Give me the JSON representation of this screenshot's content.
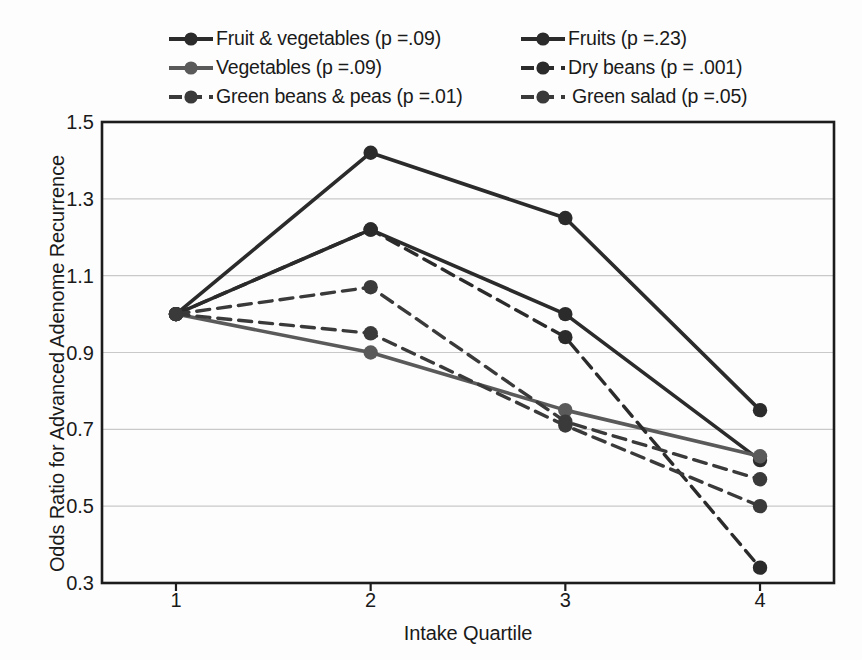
{
  "chart_data": {
    "type": "line",
    "title": "",
    "xlabel": "Intake Quartile",
    "ylabel": "Odds Ratio for Advanced Adenome Recurrence",
    "categories": [
      "1",
      "2",
      "3",
      "4"
    ],
    "x": [
      1,
      2,
      3,
      4
    ],
    "xlim": [
      0.62,
      4.38
    ],
    "ylim": [
      0.3,
      1.5
    ],
    "yticks": [
      "0.3",
      "0.5",
      "0.7",
      "0.9",
      "1.1",
      "1.3",
      "1.5"
    ],
    "ytick_values": [
      0.3,
      0.5,
      0.7,
      0.9,
      1.1,
      1.3,
      1.5
    ],
    "grid": "horizontal",
    "legend_position": "above-plot-two-columns",
    "series": [
      {
        "name": "Fruit & vegetables (p =.09)",
        "short_name": "Fruit & vegetables",
        "p_value": ".09",
        "values": [
          1.0,
          1.22,
          1.0,
          0.62
        ],
        "style": "solid",
        "color": "#2b2b2b",
        "width": 3.6
      },
      {
        "name": "Fruits (p =.23)",
        "short_name": "Fruits",
        "p_value": ".23",
        "values": [
          1.0,
          1.42,
          1.25,
          0.75
        ],
        "style": "solid",
        "color": "#2b2b2b",
        "width": 3.6
      },
      {
        "name": "Vegetables (p =.09)",
        "short_name": "Vegetables",
        "p_value": ".09",
        "values": [
          1.0,
          0.9,
          0.75,
          0.63
        ],
        "style": "solid",
        "color": "#5a5a5a",
        "width": 3.6
      },
      {
        "name": "Dry beans (p = .001)",
        "short_name": "Dry beans",
        "p_value": ".001",
        "values": [
          1.0,
          1.22,
          0.94,
          0.34
        ],
        "style": "dashed",
        "color": "#2b2b2b",
        "width": 3.4
      },
      {
        "name": "Green beans & peas (p =.01)",
        "short_name": "Green beans & peas",
        "p_value": ".01",
        "values": [
          1.0,
          1.07,
          0.72,
          0.57
        ],
        "style": "dashed",
        "color": "#3a3a3a",
        "width": 3.4
      },
      {
        "name": "Green salad (p =.05)",
        "short_name": "Green salad",
        "p_value": ".05",
        "values": [
          1.0,
          0.95,
          0.71,
          0.5
        ],
        "style": "dashed",
        "color": "#3a3a3a",
        "width": 3.4
      }
    ]
  },
  "legend": {
    "columns": [
      [
        "Fruit & vegetables (p =.09)",
        "Vegetables (p =.09)",
        "Green beans & peas (p =.01)"
      ],
      [
        "Fruits (p =.23)",
        "Dry beans (p = .001)",
        "Green salad (p =.05)"
      ]
    ],
    "order": [
      0,
      1,
      2,
      3,
      4,
      5
    ]
  },
  "axes": {
    "y_title": "Odds Ratio for Advanced Adenome Recurrence",
    "x_title": "Intake Quartile",
    "y_tick_labels": [
      "1.5",
      "1.3",
      "1.1",
      "0.9",
      "0.7",
      "0.5",
      "0.3"
    ],
    "x_tick_labels": [
      "1",
      "2",
      "3",
      "4"
    ]
  },
  "colors": {
    "frame": "#1c1c1c",
    "grid": "#c9c9c9",
    "dark_series": "#2b2b2b",
    "gray_series": "#5a5a5a",
    "background": "#fdfdfd",
    "text": "#1a1a1a"
  }
}
